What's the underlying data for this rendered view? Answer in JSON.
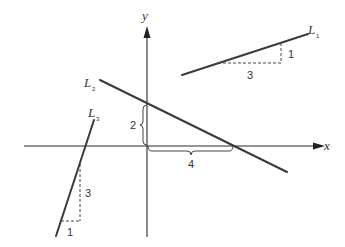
{
  "diagram": {
    "axes": {
      "x_label": "x",
      "y_label": "y"
    },
    "lines": [
      {
        "name": "L",
        "subscript": "1",
        "rise_label": "1",
        "run_label": "3",
        "slope": "1/3"
      },
      {
        "name": "L",
        "subscript": "2",
        "rise_label": "2",
        "run_label": "4",
        "slope": "-2/4"
      },
      {
        "name": "L",
        "subscript": "3",
        "rise_label": "3",
        "run_label": "1",
        "slope": "3"
      }
    ]
  }
}
